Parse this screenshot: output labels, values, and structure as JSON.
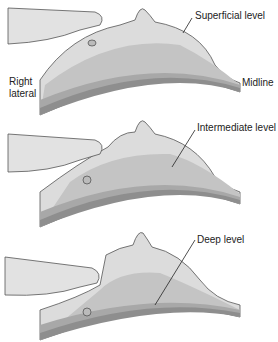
{
  "figure": {
    "panels": [
      {
        "id": "superficial",
        "label": "Superficial level"
      },
      {
        "id": "intermediate",
        "label": "Intermediate level"
      },
      {
        "id": "deep",
        "label": "Deep level"
      }
    ],
    "side_labels": {
      "right_lateral_line1": "Right",
      "right_lateral_line2": "lateral",
      "midline": "Midline"
    },
    "colors": {
      "skin_light": "#dcdcdc",
      "tissue_mid": "#c4c4c4",
      "tissue_dark": "#a8a8a8",
      "chest_wall": "#8e8e8e",
      "outline": "#555555",
      "hand": "#e2e2e2"
    }
  }
}
